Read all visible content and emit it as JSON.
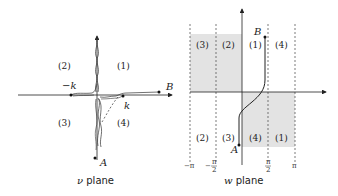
{
  "figure": {
    "left_panel": {
      "caption_symbol": "ν",
      "caption_text": " plane",
      "quadrant_labels": [
        "(1)",
        "(2)",
        "(3)",
        "(4)"
      ],
      "point_labels": {
        "neg_k": "−k",
        "k": "k",
        "A": "A",
        "B": "B"
      }
    },
    "right_panel": {
      "caption_symbol": "w",
      "caption_text": " plane",
      "upper_strip_labels": [
        "(3)",
        "(2)",
        "(1)",
        "(4)"
      ],
      "lower_strip_labels": [
        "(2)",
        "(3)",
        "(4)",
        "(1)"
      ],
      "tick_labels": [
        "−π",
        "−π/2",
        "π/2",
        "π"
      ],
      "tick_minus_pi": "−π",
      "tick_minus_half_sign": "−",
      "tick_pi_num": "π",
      "tick_half_den": "2",
      "tick_pi": "π",
      "point_labels": {
        "A": "A",
        "B": "B"
      },
      "shaded_color": "#e3e3e3"
    }
  }
}
